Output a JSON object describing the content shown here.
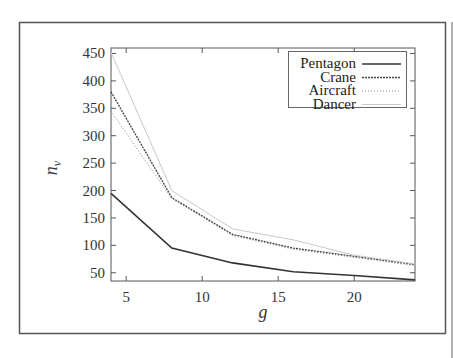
{
  "chart_data": {
    "type": "line",
    "title": "",
    "xlabel": "g",
    "ylabel": "n_v",
    "ylabel_main": "n",
    "ylabel_sub": "v",
    "x": [
      4,
      8,
      12,
      16,
      20,
      24
    ],
    "xlim": [
      4,
      24
    ],
    "ylim": [
      35,
      460
    ],
    "xticks": [
      5,
      10,
      15,
      20
    ],
    "yticks": [
      50,
      100,
      150,
      200,
      250,
      300,
      350,
      400,
      450
    ],
    "grid": false,
    "legend_position": "upper right",
    "series": [
      {
        "name": "Pentagon",
        "style": "solid",
        "values": [
          195,
          95,
          68,
          52,
          45,
          37
        ]
      },
      {
        "name": "Crane",
        "style": "dashed",
        "values": [
          380,
          187,
          120,
          95,
          80,
          65
        ]
      },
      {
        "name": "Aircraft",
        "style": "dotted",
        "values": [
          345,
          185,
          118,
          93,
          78,
          63
        ]
      },
      {
        "name": "Dancer",
        "style": "faint",
        "values": [
          452,
          200,
          130,
          110,
          82,
          66
        ]
      }
    ]
  },
  "legend": {
    "items": [
      "Pentagon",
      "Crane",
      "Aircraft",
      "Dancer"
    ]
  }
}
